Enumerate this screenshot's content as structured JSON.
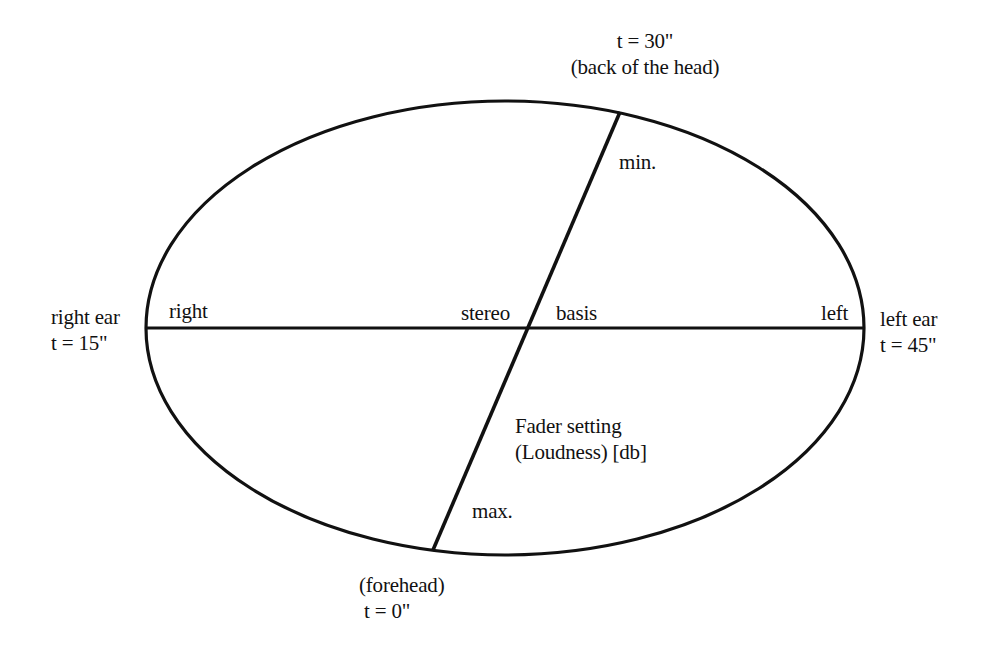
{
  "diagram": {
    "type": "head-orientation ellipse",
    "stroke_color": "#111111",
    "background": "#ffffff",
    "top_label": {
      "time": "t = 30\"",
      "position": "(back of the head)"
    },
    "bottom_label": {
      "position": "(forehead)",
      "time": "t = 0\""
    },
    "left_outer_label": {
      "position": "right ear",
      "time": "t = 15\""
    },
    "right_outer_label": {
      "position": "left ear",
      "time": "t = 45\""
    },
    "axis_labels": {
      "right": "right",
      "stereo": "stereo",
      "basis": "basis",
      "left": "left",
      "min": "min.",
      "max": "max."
    },
    "fader_label": {
      "line1": "Fader setting",
      "line2": "(Loudness) [db]"
    }
  }
}
